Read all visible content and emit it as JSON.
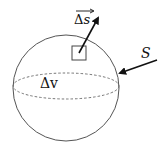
{
  "diagram": {
    "labels": {
      "surface_element_delta": "Δ",
      "surface_element_var": "s",
      "volume_element": "Δv",
      "surface": "S"
    },
    "shapes": {
      "sphere": {
        "cx": 66,
        "cy": 88,
        "r": 53
      },
      "equator": {
        "cx": 66,
        "cy": 86,
        "rx": 53,
        "ry": 13
      },
      "small_square": {
        "x": 72,
        "y": 46,
        "w": 14,
        "h": 14
      },
      "normal_vector": {
        "x1": 79,
        "y1": 53,
        "x2": 98,
        "y2": 18
      },
      "surface_pointer": {
        "x1": 157,
        "y1": 60,
        "x2": 120,
        "y2": 73
      }
    },
    "colors": {
      "stroke": "#555555",
      "arrow": "#111111",
      "text": "#111111"
    }
  }
}
